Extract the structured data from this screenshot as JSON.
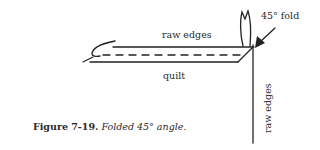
{
  "diagram": {
    "labels": {
      "top_raw_edges": "raw edges",
      "quilt": "quilt",
      "fold": "45° fold",
      "side_raw_edges": "raw edges"
    },
    "stroke_color": "#222222"
  },
  "caption": {
    "number": "Figure 7-19.",
    "description": "Folded 45° angle."
  }
}
